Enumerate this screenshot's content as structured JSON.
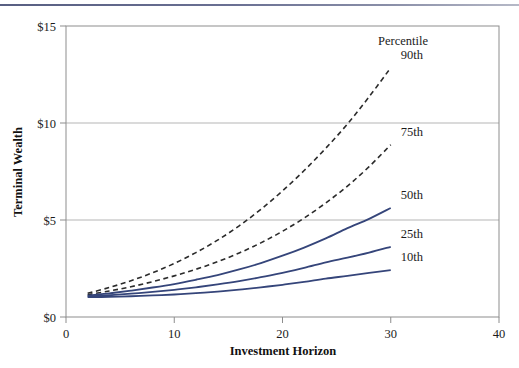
{
  "figure": {
    "top_rule_color": "#6a7093",
    "background": "#ffffff"
  },
  "chart_data": {
    "type": "line",
    "title": "",
    "subtitle": "",
    "xlabel": "Investment Horizon",
    "ylabel": "Terminal Wealth",
    "xlim": [
      0,
      40
    ],
    "ylim": [
      0,
      15
    ],
    "xticks": [
      0,
      10,
      20,
      30,
      40
    ],
    "xtick_labels": [
      "0",
      "10",
      "20",
      "30",
      "40"
    ],
    "yticks": [
      0,
      5,
      10,
      15
    ],
    "ytick_labels": [
      "$0",
      "$5",
      "$10",
      "$15"
    ],
    "grid": "horizontal",
    "grid_color": "#b5b5b5",
    "frame_color": "#8d8d8d",
    "legend_position": "inline-right-of-curve-ends",
    "legend_title": "Percentile",
    "x": [
      2,
      4,
      6,
      8,
      10,
      12,
      14,
      16,
      18,
      20,
      22,
      24,
      26,
      28,
      30
    ],
    "series": [
      {
        "name": "90th",
        "label": "90th",
        "style": "dashed",
        "color": "#2b2b2b",
        "values": [
          1.22,
          1.52,
          1.87,
          2.28,
          2.76,
          3.32,
          3.96,
          4.7,
          5.55,
          6.5,
          7.55,
          8.7,
          9.95,
          11.35,
          12.85
        ]
      },
      {
        "name": "75th",
        "label": "75th",
        "style": "dashed",
        "color": "#2b2b2b",
        "values": [
          1.15,
          1.34,
          1.56,
          1.82,
          2.12,
          2.46,
          2.85,
          3.3,
          3.82,
          4.42,
          5.1,
          5.88,
          6.75,
          7.75,
          8.88
        ]
      },
      {
        "name": "50th",
        "label": "50th",
        "style": "solid",
        "color": "#35457a",
        "values": [
          1.1,
          1.22,
          1.36,
          1.52,
          1.7,
          1.92,
          2.16,
          2.45,
          2.78,
          3.16,
          3.58,
          4.05,
          4.58,
          5.06,
          5.62
        ]
      },
      {
        "name": "25th",
        "label": "25th",
        "style": "solid",
        "color": "#35457a",
        "values": [
          1.06,
          1.12,
          1.2,
          1.29,
          1.4,
          1.53,
          1.68,
          1.85,
          2.05,
          2.28,
          2.53,
          2.82,
          3.06,
          3.32,
          3.62
        ]
      },
      {
        "name": "10th",
        "label": "10th",
        "style": "solid",
        "color": "#35457a",
        "values": [
          1.02,
          1.04,
          1.07,
          1.11,
          1.16,
          1.23,
          1.31,
          1.41,
          1.53,
          1.66,
          1.81,
          1.98,
          2.12,
          2.27,
          2.42
        ]
      }
    ]
  }
}
